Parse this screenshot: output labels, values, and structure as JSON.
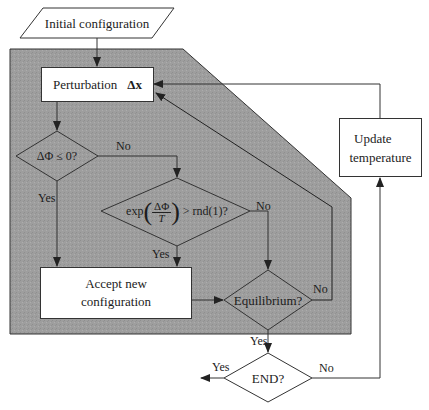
{
  "diagram": {
    "colors": {
      "shaded_region": "#9e9e9e",
      "line": "#333333",
      "box_fill": "#ffffff",
      "text": "#1c1c1c"
    },
    "nodes": {
      "start": {
        "label": "Initial configuration",
        "shape": "parallelogram"
      },
      "perturb": {
        "label": "Perturbation",
        "symbol": "Δx",
        "shape": "rectangle"
      },
      "decision1": {
        "label": "ΔΦ ≤ 0?",
        "shape": "diamond"
      },
      "decision2": {
        "prefix": "exp",
        "numerator": "ΔΦ",
        "denominator": "T",
        "suffix": "> rnd(1)?",
        "shape": "diamond"
      },
      "accept": {
        "line1": "Accept new",
        "line2": "configuration",
        "shape": "rectangle"
      },
      "equilibrium": {
        "label": "Equilibrium?",
        "shape": "diamond"
      },
      "update": {
        "line1": "Update",
        "line2": "temperature",
        "shape": "rectangle"
      },
      "end": {
        "label": "END?",
        "shape": "diamond"
      }
    },
    "edge_labels": {
      "d1_no": "No",
      "d1_yes": "Yes",
      "d2_no": "No",
      "d2_yes": "Yes",
      "eq_no": "No",
      "eq_yes": "Yes",
      "end_yes": "Yes",
      "end_no": "No"
    }
  }
}
